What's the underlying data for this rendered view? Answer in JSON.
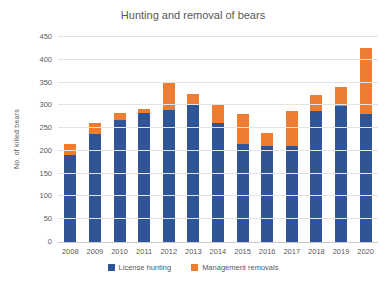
{
  "chart_data": {
    "type": "bar",
    "stacked": true,
    "title": "Hunting and removal of bears",
    "xlabel": "",
    "ylabel": "No. of killed bears",
    "ylim": [
      0,
      450
    ],
    "ytick_step": 50,
    "grid": true,
    "legend_position": "bottom",
    "categories": [
      2008,
      2009,
      2010,
      2011,
      2012,
      2013,
      2014,
      2015,
      2016,
      2017,
      2018,
      2019,
      2020
    ],
    "series": [
      {
        "name": "License hunting",
        "color": "#2F5597",
        "values": [
          190,
          238,
          268,
          283,
          290,
          301,
          261,
          216,
          211,
          211,
          288,
          299,
          281
        ]
      },
      {
        "name": "Management removals",
        "color": "#ED7D31",
        "values": [
          25,
          24,
          15,
          10,
          60,
          24,
          39,
          66,
          29,
          77,
          34,
          41,
          145
        ]
      }
    ],
    "totals": [
      215,
      262,
      283,
      293,
      350,
      325,
      300,
      282,
      240,
      288,
      322,
      340,
      426
    ],
    "text_color": "#595959",
    "gridline_color": "#E4E4E4"
  }
}
